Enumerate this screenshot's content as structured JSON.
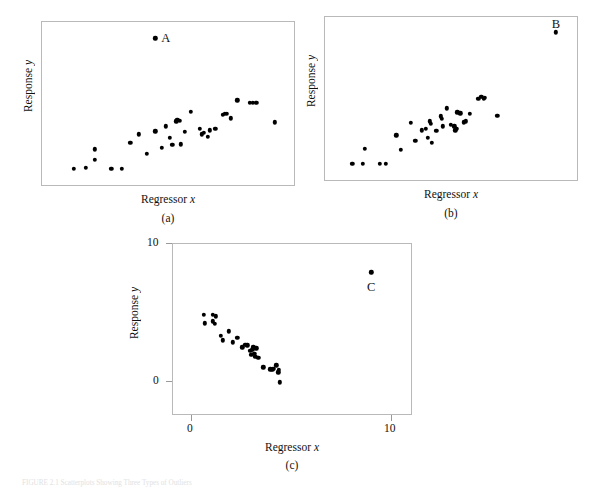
{
  "figure": {
    "caption": "FIGURE 2.1 Scatterplots Showing Three Types of Outliers",
    "axis_labels": {
      "x": "Regressor x",
      "y": "Response y"
    }
  },
  "panels": [
    {
      "id": "a",
      "sublabel": "(a)",
      "xlabel": "Regressor x",
      "ylabel": "Response y",
      "outlier_label": "A",
      "show_ticks": false
    },
    {
      "id": "b",
      "sublabel": "(b)",
      "xlabel": "Regressor x",
      "ylabel": "Response y",
      "outlier_label": "B",
      "show_ticks": false
    },
    {
      "id": "c",
      "sublabel": "(c)",
      "xlabel": "Regressor x",
      "ylabel": "Response y",
      "outlier_label": "C",
      "show_ticks": true,
      "xticks": [
        "0",
        "10"
      ],
      "yticks": [
        "0",
        "10"
      ]
    }
  ],
  "chart_data": [
    {
      "type": "scatter",
      "panel": "a",
      "title": "",
      "xlabel": "Regressor x",
      "ylabel": "Response y",
      "xlim": [
        0,
        12
      ],
      "ylim": [
        0,
        10
      ],
      "grid": false,
      "legend": null,
      "annotations": [
        {
          "text": "A",
          "x": 5.9,
          "y": 9.0,
          "note": "y-direction outlier, mid-range x"
        }
      ],
      "series": [
        {
          "name": "observations",
          "color": "#000000",
          "points": [
            [
              1.5,
              1.0
            ],
            [
              2.1,
              1.05
            ],
            [
              2.5,
              1.55
            ],
            [
              2.5,
              2.2
            ],
            [
              3.3,
              1.0
            ],
            [
              3.8,
              1.0
            ],
            [
              4.2,
              2.6
            ],
            [
              4.6,
              3.1
            ],
            [
              5.0,
              1.9
            ],
            [
              5.4,
              3.3
            ],
            [
              5.7,
              2.3
            ],
            [
              5.9,
              3.6
            ],
            [
              6.1,
              2.9
            ],
            [
              6.2,
              2.45
            ],
            [
              6.4,
              3.9
            ],
            [
              6.45,
              4.0
            ],
            [
              6.55,
              3.95
            ],
            [
              6.6,
              2.5
            ],
            [
              6.8,
              3.25
            ],
            [
              7.1,
              4.5
            ],
            [
              7.5,
              3.45
            ],
            [
              7.6,
              3.1
            ],
            [
              7.7,
              3.2
            ],
            [
              7.9,
              2.95
            ],
            [
              8.0,
              3.35
            ],
            [
              8.25,
              3.45
            ],
            [
              8.6,
              4.3
            ],
            [
              8.7,
              4.35
            ],
            [
              8.8,
              4.35
            ],
            [
              9.0,
              4.1
            ],
            [
              9.3,
              5.2
            ],
            [
              9.9,
              5.05
            ],
            [
              10.05,
              5.05
            ],
            [
              10.2,
              5.05
            ],
            [
              11.1,
              3.85
            ]
          ]
        },
        {
          "name": "outlier-A",
          "color": "#000000",
          "points": [
            [
              5.4,
              9.0
            ]
          ]
        }
      ]
    },
    {
      "type": "scatter",
      "panel": "b",
      "title": "",
      "xlabel": "Regressor x",
      "ylabel": "Response y",
      "xlim": [
        0,
        12
      ],
      "ylim": [
        0,
        10
      ],
      "grid": false,
      "legend": null,
      "annotations": [
        {
          "text": "B",
          "x": 11.0,
          "y": 9.6,
          "note": "high-leverage point consistent with trend"
        }
      ],
      "series": [
        {
          "name": "observations",
          "color": "#000000",
          "points": [
            [
              1.3,
              1.0
            ],
            [
              1.8,
              1.0
            ],
            [
              1.9,
              1.9
            ],
            [
              2.6,
              1.0
            ],
            [
              2.9,
              1.0
            ],
            [
              3.4,
              2.75
            ],
            [
              3.6,
              1.85
            ],
            [
              4.1,
              3.5
            ],
            [
              4.3,
              2.4
            ],
            [
              4.6,
              3.05
            ],
            [
              4.8,
              3.15
            ],
            [
              4.9,
              2.6
            ],
            [
              5.0,
              3.6
            ],
            [
              5.05,
              3.45
            ],
            [
              5.1,
              2.3
            ],
            [
              5.3,
              3.0
            ],
            [
              5.5,
              3.9
            ],
            [
              5.55,
              3.75
            ],
            [
              5.6,
              3.3
            ],
            [
              5.8,
              4.4
            ],
            [
              6.0,
              3.4
            ],
            [
              6.15,
              3.3
            ],
            [
              6.2,
              3.05
            ],
            [
              6.25,
              3.15
            ],
            [
              6.3,
              4.15
            ],
            [
              6.45,
              4.1
            ],
            [
              6.6,
              3.55
            ],
            [
              6.7,
              3.6
            ],
            [
              6.9,
              4.05
            ],
            [
              7.3,
              5.0
            ],
            [
              7.45,
              5.1
            ],
            [
              7.55,
              5.0
            ],
            [
              7.6,
              5.05
            ],
            [
              8.2,
              3.95
            ]
          ]
        },
        {
          "name": "outlier-B",
          "color": "#000000",
          "points": [
            [
              11.0,
              9.05
            ]
          ]
        }
      ]
    },
    {
      "type": "scatter",
      "panel": "c",
      "title": "",
      "xlabel": "Regressor x",
      "ylabel": "Response y",
      "xlim": [
        0,
        12
      ],
      "ylim": [
        -2,
        10
      ],
      "grid": false,
      "legend": null,
      "annotations": [
        {
          "text": "C",
          "x": 10.0,
          "y": 7.0,
          "note": "influential outlier against negative trend"
        }
      ],
      "series": [
        {
          "name": "observations",
          "color": "#000000",
          "points": [
            [
              1.55,
              5.0
            ],
            [
              1.6,
              4.4
            ],
            [
              2.0,
              5.0
            ],
            [
              2.0,
              4.55
            ],
            [
              2.1,
              4.35
            ],
            [
              2.15,
              4.9
            ],
            [
              2.4,
              3.5
            ],
            [
              2.5,
              3.2
            ],
            [
              2.8,
              3.85
            ],
            [
              3.0,
              3.05
            ],
            [
              3.25,
              3.4
            ],
            [
              3.5,
              2.7
            ],
            [
              3.65,
              2.9
            ],
            [
              3.75,
              2.85
            ],
            [
              3.9,
              2.45
            ],
            [
              3.95,
              2.2
            ],
            [
              4.0,
              2.55
            ],
            [
              4.05,
              2.7
            ],
            [
              4.1,
              2.25
            ],
            [
              4.15,
              2.05
            ],
            [
              4.2,
              2.65
            ],
            [
              4.3,
              1.95
            ],
            [
              4.55,
              1.3
            ],
            [
              4.9,
              1.15
            ],
            [
              5.0,
              1.1
            ],
            [
              5.05,
              1.2
            ],
            [
              5.2,
              1.45
            ],
            [
              5.3,
              0.95
            ],
            [
              5.35,
              1.1
            ],
            [
              5.4,
              0.25
            ]
          ]
        },
        {
          "name": "outlier-C",
          "color": "#000000",
          "points": [
            [
              10.0,
              8.0
            ]
          ]
        }
      ]
    }
  ]
}
